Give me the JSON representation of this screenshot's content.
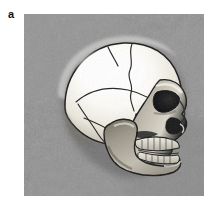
{
  "figure": {
    "panel_label": "a",
    "caption": "",
    "image_kind": "grayscale-photograph",
    "background_color": "#8e8e8e",
    "bone_highlight_color": "#fdfdfb",
    "bone_midtone_color": "#c8c3b8",
    "bone_shadow_color": "#8a8578",
    "outline_color": "#1c1c1c",
    "cavity_color": "#141414",
    "panel_frame": {
      "x": 24,
      "y": 14,
      "width": 180,
      "height": 182
    },
    "anatomy_labels": [
      "cranial-vault",
      "coronal-suture",
      "sagittal-suture-trace",
      "squamous-suture",
      "temporal-bone",
      "occipital-region",
      "orbit",
      "nasal-aperture",
      "zygomatic-arch",
      "maxilla-teeth",
      "mandible-teeth",
      "mandibular-ramus",
      "mental-protuberance"
    ]
  }
}
